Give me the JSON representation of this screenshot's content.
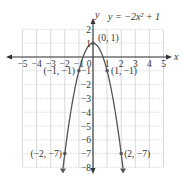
{
  "chart_data": {
    "type": "line",
    "title": "y = −2x² + 1",
    "equation_label": "y = −2x² + 1",
    "xlabel": "x",
    "ylabel": "y",
    "xlim": [
      -5,
      5
    ],
    "ylim": [
      -8,
      2
    ],
    "grid": true,
    "x_ticks": [
      -5,
      -4,
      -3,
      -2,
      -1,
      0,
      1,
      2,
      3,
      4,
      5
    ],
    "x_tick_labels": [
      "−5",
      "−4",
      "−3",
      "−2",
      "−1",
      "0",
      "1",
      "2",
      "3",
      "4",
      "5"
    ],
    "y_ticks": [
      2,
      1,
      -1,
      -2,
      -3,
      -4,
      -5,
      -6,
      -7,
      -8
    ],
    "y_tick_labels": [
      "2",
      "1",
      "−1",
      "−2",
      "−3",
      "−4",
      "−5",
      "−6",
      "−7",
      "−8"
    ],
    "series": [
      {
        "name": "y = −2x² + 1",
        "x": [
          -2.13,
          -2,
          -1.5,
          -1,
          -0.5,
          0,
          0.5,
          1,
          1.5,
          2,
          2.13
        ],
        "y": [
          -8.07,
          -7,
          -3.5,
          -1,
          0.5,
          1,
          0.5,
          -1,
          -3.5,
          -7,
          -8.07
        ]
      }
    ],
    "annotations": [
      {
        "x": 0,
        "y": 1,
        "label": "(0, 1)"
      },
      {
        "x": -1,
        "y": -1,
        "label": "(−1, −1)"
      },
      {
        "x": 1,
        "y": -1,
        "label": "(1, −1)"
      },
      {
        "x": -2,
        "y": -7,
        "label": "(−2, −7)"
      },
      {
        "x": 2,
        "y": -7,
        "label": "(2, −7)"
      }
    ]
  },
  "colors": {
    "curve": "#555555",
    "axis": "#333333",
    "grid": "#c8c8c8",
    "text": "#333333"
  }
}
